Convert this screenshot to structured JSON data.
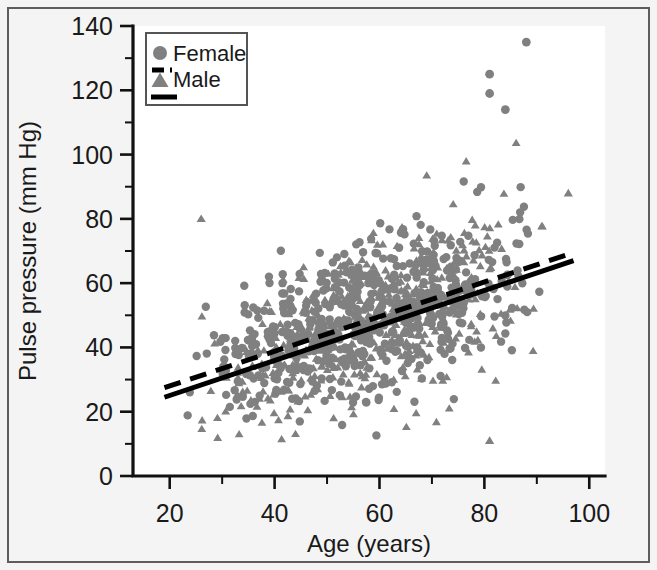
{
  "figure": {
    "background": "#f4f4f4",
    "plot_background": "#ffffff",
    "marker_color": "#808080",
    "line_color": "#000000"
  },
  "chart_data": {
    "type": "scatter",
    "title": "",
    "subtitle": "",
    "xlabel": "Age (years)",
    "ylabel": "Pulse pressure (mm Hg)",
    "xlim": [
      13,
      103
    ],
    "ylim": [
      0,
      140
    ],
    "xticks": [
      20,
      40,
      60,
      80,
      100
    ],
    "xtick_labels": [
      "20",
      "40",
      "60",
      "80",
      "100"
    ],
    "xminor_ticks": [
      30,
      50,
      70,
      90
    ],
    "yticks": [
      0,
      20,
      40,
      60,
      80,
      100,
      120,
      140
    ],
    "ytick_labels": [
      "0",
      "20",
      "40",
      "60",
      "80",
      "100",
      "120",
      "140"
    ],
    "yminor_ticks": [
      10,
      30,
      50,
      70,
      90,
      110,
      130
    ],
    "grid": false,
    "legend_position": "top-left",
    "legend": [
      {
        "label": "Female",
        "marker": "circle",
        "line": "dashed",
        "color": "#808080"
      },
      {
        "label": "Male",
        "marker": "triangle",
        "line": "solid",
        "color": "#808080"
      }
    ],
    "series": [
      {
        "name": "Female",
        "marker": "circle",
        "n_points": 560,
        "x_range": [
          19,
          97
        ],
        "y_mean_at_x20": 30,
        "y_mean_at_x95": 68,
        "y_scatter_sd": 11,
        "fit_line": {
          "style": "dashed",
          "x_start": 19,
          "y_start": 27.5,
          "x_end": 97,
          "y_end": 69.5,
          "slope": 0.538,
          "intercept": 17.3
        }
      },
      {
        "name": "Male",
        "marker": "triangle",
        "n_points": 470,
        "x_range": [
          20,
          97
        ],
        "y_mean_at_x20": 34,
        "y_mean_at_x95": 67,
        "y_scatter_sd": 12,
        "fit_line": {
          "style": "solid",
          "x_start": 19,
          "y_start": 24.5,
          "x_end": 97,
          "y_end": 67.0,
          "slope": 0.545,
          "intercept": 14.2
        }
      }
    ],
    "notable_points": [
      {
        "series": "Female",
        "x": 88,
        "y": 135,
        "note": "highest value"
      },
      {
        "series": "Female",
        "x": 81,
        "y": 125,
        "note": "high outlier"
      },
      {
        "series": "Female",
        "x": 81,
        "y": 119,
        "note": "high outlier"
      },
      {
        "series": "Female",
        "x": 84,
        "y": 114,
        "note": "high outlier"
      },
      {
        "series": "Male",
        "x": 81,
        "y": 11,
        "note": "low outlier"
      },
      {
        "series": "Male",
        "x": 26,
        "y": 80,
        "note": "young high outlier"
      },
      {
        "series": "Male",
        "x": 96,
        "y": 88,
        "note": "oldest high point"
      }
    ]
  }
}
